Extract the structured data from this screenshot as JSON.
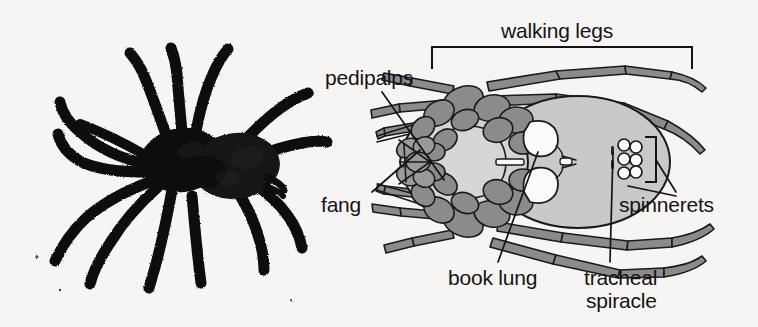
{
  "figure": {
    "background_color": "#f6f5f3",
    "ink_color": "#141414",
    "leg_fill": "#8b8b8b",
    "abdomen_fill": "#c9c9c9",
    "body_fill": "#a8a8a8",
    "organ_fill": "#fbfbfb",
    "spider_color": "#0d0d0d"
  },
  "labels": {
    "walking_legs": "walking legs",
    "pedipalps": "pedipalps",
    "fang": "fang",
    "spinnerets": "spinnerets",
    "book_lung": "book lung",
    "tracheal": "tracheal",
    "spiracle": "spiracle"
  },
  "panels": {
    "left": {
      "name": "photographic spider illustration",
      "subject": "black spider, dorsal view, eight legs"
    },
    "right": {
      "name": "labelled ventral anatomy diagram",
      "parts": [
        "walking legs",
        "pedipalps",
        "fang",
        "spinnerets",
        "book lung",
        "tracheal spiracle"
      ]
    }
  }
}
